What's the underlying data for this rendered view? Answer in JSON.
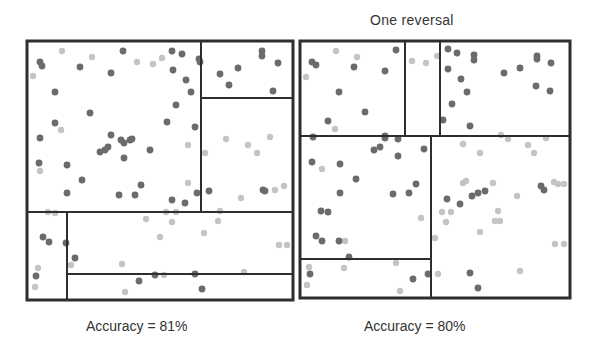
{
  "figure": {
    "title_right": "One reversal",
    "panels": [
      {
        "id": "left",
        "caption": "Accuracy = 81%",
        "accuracy_percent": 81,
        "frame": {
          "x": 27,
          "y": 41,
          "w": 266,
          "h": 259
        },
        "split_lines": [
          {
            "x1": 201,
            "y1": 41,
            "x2": 201,
            "y2": 212
          },
          {
            "x1": 201,
            "y1": 98,
            "x2": 293,
            "y2": 98
          },
          {
            "x1": 27,
            "y1": 212,
            "x2": 293,
            "y2": 212
          },
          {
            "x1": 67,
            "y1": 212,
            "x2": 67,
            "y2": 300
          },
          {
            "x1": 67,
            "y1": 274,
            "x2": 293,
            "y2": 274
          }
        ],
        "dark_points": [
          [
            40,
            62
          ],
          [
            42,
            66
          ],
          [
            80,
            67
          ],
          [
            111,
            73
          ],
          [
            123,
            51
          ],
          [
            172,
            51
          ],
          [
            182,
            54
          ],
          [
            173,
            70
          ],
          [
            186,
            80
          ],
          [
            191,
            92
          ],
          [
            176,
            105
          ],
          [
            55,
            92
          ],
          [
            90,
            113
          ],
          [
            55,
            123
          ],
          [
            167,
            122
          ],
          [
            195,
            127
          ],
          [
            40,
            138
          ],
          [
            111,
            135
          ],
          [
            121,
            140
          ],
          [
            124,
            143
          ],
          [
            130,
            140
          ],
          [
            132,
            139
          ],
          [
            100,
            152
          ],
          [
            105,
            150
          ],
          [
            108,
            147
          ],
          [
            124,
            158
          ],
          [
            150,
            150
          ],
          [
            39,
            163
          ],
          [
            67,
            165
          ],
          [
            82,
            180
          ],
          [
            67,
            193
          ],
          [
            119,
            195
          ],
          [
            135,
            195
          ],
          [
            141,
            185
          ],
          [
            172,
            200
          ],
          [
            185,
            203
          ],
          [
            197,
            193
          ],
          [
            209,
            191
          ],
          [
            199,
            59
          ],
          [
            200,
            62
          ],
          [
            220,
            74
          ],
          [
            238,
            68
          ],
          [
            229,
            85
          ],
          [
            262,
            51
          ],
          [
            262,
            56
          ],
          [
            278,
            63
          ],
          [
            273,
            91
          ],
          [
            263,
            190
          ],
          [
            265,
            191
          ],
          [
            43,
            237
          ],
          [
            49,
            242
          ],
          [
            66,
            243
          ],
          [
            75,
            258
          ],
          [
            36,
            276
          ],
          [
            139,
            281
          ],
          [
            155,
            275
          ],
          [
            195,
            274
          ],
          [
            202,
            289
          ]
        ],
        "light_points": [
          [
            62,
            51
          ],
          [
            92,
            57
          ],
          [
            137,
            62
          ],
          [
            153,
            64
          ],
          [
            162,
            58
          ],
          [
            33,
            76
          ],
          [
            61,
            130
          ],
          [
            40,
            171
          ],
          [
            188,
            145
          ],
          [
            205,
            153
          ],
          [
            226,
            139
          ],
          [
            248,
            145
          ],
          [
            257,
            153
          ],
          [
            270,
            137
          ],
          [
            275,
            190
          ],
          [
            284,
            186
          ],
          [
            241,
            198
          ],
          [
            188,
            183
          ],
          [
            48,
            212
          ],
          [
            55,
            213
          ],
          [
            166,
            212
          ],
          [
            176,
            212
          ],
          [
            220,
            211
          ],
          [
            146,
            219
          ],
          [
            172,
            222
          ],
          [
            218,
            221
          ],
          [
            160,
            237
          ],
          [
            204,
            233
          ],
          [
            279,
            245
          ],
          [
            287,
            245
          ],
          [
            71,
            265
          ],
          [
            122,
            264
          ],
          [
            38,
            268
          ],
          [
            35,
            287
          ],
          [
            164,
            275
          ],
          [
            244,
            272
          ],
          [
            125,
            292
          ]
        ]
      },
      {
        "id": "right",
        "caption": "Accuracy = 80%",
        "accuracy_percent": 80,
        "frame": {
          "x": 300,
          "y": 41,
          "w": 270,
          "h": 257
        },
        "split_lines": [
          {
            "x1": 405,
            "y1": 41,
            "x2": 405,
            "y2": 136
          },
          {
            "x1": 440,
            "y1": 41,
            "x2": 440,
            "y2": 136
          },
          {
            "x1": 300,
            "y1": 136,
            "x2": 570,
            "y2": 136
          },
          {
            "x1": 431,
            "y1": 136,
            "x2": 431,
            "y2": 298
          },
          {
            "x1": 300,
            "y1": 259,
            "x2": 431,
            "y2": 259
          }
        ],
        "dark_points": [
          [
            312,
            62
          ],
          [
            316,
            65
          ],
          [
            354,
            67
          ],
          [
            396,
            50
          ],
          [
            385,
            71
          ],
          [
            339,
            92
          ],
          [
            365,
            112
          ],
          [
            328,
            121
          ],
          [
            313,
            137
          ],
          [
            385,
            136
          ],
          [
            385,
            138
          ],
          [
            398,
            139
          ],
          [
            380,
            147
          ],
          [
            374,
            150
          ],
          [
            398,
            156
          ],
          [
            424,
            149
          ],
          [
            312,
            162
          ],
          [
            340,
            164
          ],
          [
            356,
            179
          ],
          [
            340,
            193
          ],
          [
            393,
            194
          ],
          [
            409,
            193
          ],
          [
            416,
            184
          ],
          [
            321,
            211
          ],
          [
            328,
            212
          ],
          [
            316,
            236
          ],
          [
            322,
            241
          ],
          [
            339,
            241
          ],
          [
            349,
            257
          ],
          [
            310,
            274
          ],
          [
            413,
            279
          ],
          [
            428,
            274
          ],
          [
            448,
            49
          ],
          [
            457,
            53
          ],
          [
            474,
            55
          ],
          [
            474,
            60
          ],
          [
            448,
            69
          ],
          [
            461,
            79
          ],
          [
            467,
            92
          ],
          [
            504,
            73
          ],
          [
            520,
            68
          ],
          [
            536,
            86
          ],
          [
            537,
            56
          ],
          [
            537,
            59
          ],
          [
            551,
            63
          ],
          [
            550,
            91
          ],
          [
            452,
            104
          ],
          [
            443,
            120
          ],
          [
            470,
            126
          ],
          [
            447,
            199
          ],
          [
            460,
            204
          ],
          [
            472,
            196
          ],
          [
            485,
            191
          ],
          [
            478,
            193
          ],
          [
            541,
            186
          ],
          [
            544,
            190
          ],
          [
            470,
            273
          ],
          [
            478,
            288
          ]
        ],
        "light_points": [
          [
            336,
            51
          ],
          [
            357,
            57
          ],
          [
            306,
            77
          ],
          [
            335,
            129
          ],
          [
            412,
            61
          ],
          [
            426,
            63
          ],
          [
            437,
            56
          ],
          [
            322,
            169
          ],
          [
            345,
            241
          ],
          [
            421,
            218
          ],
          [
            309,
            267
          ],
          [
            344,
            268
          ],
          [
            396,
            263
          ],
          [
            400,
            291
          ],
          [
            307,
            285
          ],
          [
            463,
            144
          ],
          [
            480,
            153
          ],
          [
            508,
            139
          ],
          [
            528,
            145
          ],
          [
            534,
            153
          ],
          [
            463,
            183
          ],
          [
            466,
            181
          ],
          [
            493,
            183
          ],
          [
            554,
            182
          ],
          [
            558,
            184
          ],
          [
            564,
            184
          ],
          [
            517,
            196
          ],
          [
            442,
            212
          ],
          [
            451,
            212
          ],
          [
            446,
            222
          ],
          [
            498,
            211
          ],
          [
            495,
            221
          ],
          [
            500,
            221
          ],
          [
            480,
            232
          ],
          [
            555,
            244
          ],
          [
            564,
            244
          ],
          [
            438,
            274
          ],
          [
            520,
            271
          ],
          [
            546,
            138
          ],
          [
            501,
            135
          ],
          [
            435,
            238
          ]
        ]
      }
    ],
    "colors": {
      "dark_point": "#6b6b6b",
      "light_point": "#c4c4c4",
      "frame": "#2e2e2e",
      "text": "#333333"
    }
  }
}
